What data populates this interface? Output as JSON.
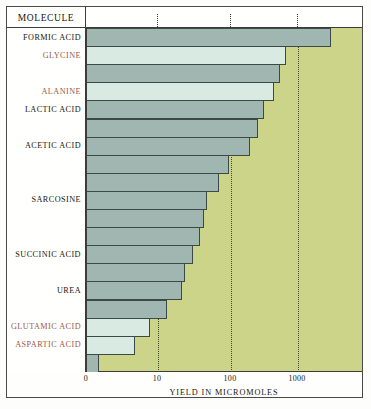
{
  "header": {
    "column_title": "MOLECULE"
  },
  "axis": {
    "title": "YIELD IN MICROMOLES",
    "ticks": [
      {
        "label": "0",
        "x": 0
      },
      {
        "label": "10",
        "x": 71
      },
      {
        "label": "100",
        "x": 144
      },
      {
        "label": "1000",
        "x": 211
      }
    ]
  },
  "colors": {
    "plot_background": "#cbd489",
    "bar_dark": "#9fb7b0",
    "bar_light": "#d8eae2",
    "bar_stroke": "#3b4a46",
    "label_text": "#16160f",
    "accent_label_text": "#9a5a4a",
    "gridline": "#3f4a26"
  },
  "chart_data": {
    "type": "bar",
    "orientation": "horizontal",
    "title": "",
    "xlabel": "YIELD IN MICROMOLES",
    "ylabel": "MOLECULE",
    "xscale": "log",
    "xticks": [
      0,
      10,
      100,
      1000
    ],
    "grid": true,
    "legend": "none",
    "categories": [
      "FORMIC ACID",
      "GLYCINE",
      "",
      "ALANINE",
      "LACTIC ACID",
      "",
      "ACETIC ACID",
      "",
      "",
      "SARCOSINE",
      "",
      "",
      "SUCCINIC ACID",
      "",
      "UREA",
      "",
      "GLUTAMIC ACID",
      "ASPARTIC ACID",
      ""
    ],
    "bars": [
      {
        "label": "FORMIC ACID",
        "value": 2330,
        "shade": "dark",
        "px_width": 244
      },
      {
        "label": "GLYCINE",
        "value": 630,
        "shade": "light",
        "px_width": 199
      },
      {
        "label": "",
        "value": 570,
        "shade": "dark",
        "px_width": 193
      },
      {
        "label": "ALANINE",
        "value": 340,
        "shade": "light",
        "px_width": 187
      },
      {
        "label": "LACTIC ACID",
        "value": 310,
        "shade": "dark",
        "px_width": 177
      },
      {
        "label": "",
        "value": 255,
        "shade": "dark",
        "px_width": 171
      },
      {
        "label": "ACETIC ACID",
        "value": 152,
        "shade": "dark",
        "px_width": 163
      },
      {
        "label": "",
        "value": 86,
        "shade": "dark",
        "px_width": 142
      },
      {
        "label": "",
        "value": 60,
        "shade": "dark",
        "px_width": 132
      },
      {
        "label": "SARCOSINE",
        "value": 40,
        "shade": "dark",
        "px_width": 120
      },
      {
        "label": "",
        "value": 37,
        "shade": "dark",
        "px_width": 117
      },
      {
        "label": "",
        "value": 34,
        "shade": "dark",
        "px_width": 113
      },
      {
        "label": "SUCCINIC ACID",
        "value": 27,
        "shade": "dark",
        "px_width": 106
      },
      {
        "label": "",
        "value": 23,
        "shade": "dark",
        "px_width": 98
      },
      {
        "label": "UREA",
        "value": 21,
        "shade": "dark",
        "px_width": 95
      },
      {
        "label": "",
        "value": 15,
        "shade": "dark",
        "px_width": 80
      },
      {
        "label": "GLUTAMIC ACID",
        "value": 11,
        "shade": "light",
        "px_width": 63
      },
      {
        "label": "ASPARTIC ACID",
        "value": 8,
        "shade": "light",
        "px_width": 48
      },
      {
        "label": "",
        "value": 1.5,
        "shade": "dark",
        "px_width": 12
      }
    ],
    "row_labels": [
      {
        "text": "FORMIC ACID",
        "row": 0,
        "accent": false
      },
      {
        "text": "GLYCINE",
        "row": 1,
        "accent": true
      },
      {
        "text": "ALANINE",
        "row": 3,
        "accent": true
      },
      {
        "text": "LACTIC ACID",
        "row": 4,
        "accent": false
      },
      {
        "text": "ACETIC ACID",
        "row": 6,
        "accent": false
      },
      {
        "text": "SARCOSINE",
        "row": 9,
        "accent": false
      },
      {
        "text": "SUCCINIC ACID",
        "row": 12,
        "accent": false
      },
      {
        "text": "UREA",
        "row": 14,
        "accent": false
      },
      {
        "text": "GLUTAMIC ACID",
        "row": 16,
        "accent": true
      },
      {
        "text": "ASPARTIC ACID",
        "row": 17,
        "accent": true
      }
    ]
  }
}
